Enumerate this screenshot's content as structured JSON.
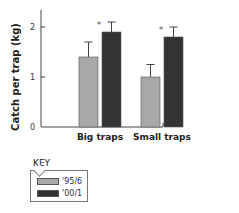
{
  "chart_data": {
    "type": "bar",
    "title": "",
    "xlabel": "",
    "ylabel": "Catch per trap (kg)",
    "ylim": [
      0,
      2.4
    ],
    "yticks": [
      0,
      1,
      2
    ],
    "ytick_labels": [
      "0",
      "1",
      "2"
    ],
    "categories": [
      "Big traps",
      "Small traps"
    ],
    "series": [
      {
        "name": "'95/6",
        "color": "#a8a8a8",
        "values": [
          1.4,
          1.0
        ],
        "errors": [
          0.3,
          0.25
        ]
      },
      {
        "name": "'00/1",
        "color": "#333333",
        "values": [
          1.9,
          1.8
        ],
        "errors": [
          0.2,
          0.2
        ]
      }
    ],
    "annotations": [
      {
        "category": "Big traps",
        "text": "*"
      },
      {
        "category": "Small traps",
        "text": "*"
      }
    ],
    "grid": false,
    "legend_position": "bottom-left"
  },
  "legend": {
    "title": "KEY",
    "items": [
      {
        "label": "'95/6",
        "color": "#a8a8a8"
      },
      {
        "label": "'00/1",
        "color": "#333333"
      }
    ]
  }
}
